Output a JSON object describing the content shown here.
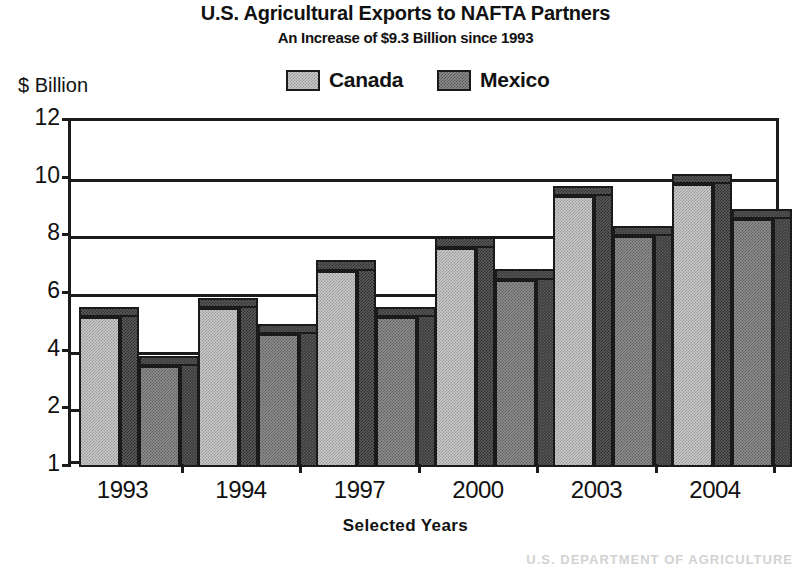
{
  "chart_data": {
    "type": "bar",
    "title": "U.S. Agricultural Exports to NAFTA Partners",
    "subtitle": "An Increase of $9.3 Billion since 1993",
    "xlabel": "Selected Years",
    "ylabel": "$ Billion",
    "categories": [
      "1993",
      "1994",
      "1997",
      "2000",
      "2003",
      "2004"
    ],
    "series": [
      {
        "name": "Canada",
        "color": "#c9c9c9",
        "values": [
          5.2,
          5.5,
          6.8,
          7.6,
          9.4,
          9.8
        ]
      },
      {
        "name": "Mexico",
        "color": "#8d8d8d",
        "values": [
          3.5,
          4.6,
          5.2,
          6.5,
          8.0,
          8.6
        ]
      }
    ],
    "ylim": [
      0,
      12
    ],
    "yticks": [
      12,
      10,
      8,
      6,
      4,
      2,
      1
    ],
    "ytick_labels": [
      "12",
      "10",
      "8",
      "6",
      "4",
      "2",
      "1"
    ],
    "grid": true,
    "grid_axis": "y",
    "legend_position": "top-center",
    "style": "3d-bar"
  },
  "legend": {
    "entries": [
      {
        "label": "Canada"
      },
      {
        "label": "Mexico"
      }
    ]
  },
  "footer": {
    "source": "U.S. DEPARTMENT OF AGRICULTURE"
  }
}
